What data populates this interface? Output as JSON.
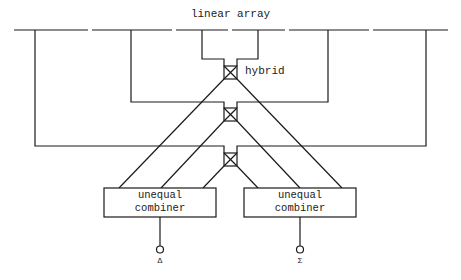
{
  "diagram": {
    "title": "linear array",
    "hybrid_label": "hybrid",
    "combiners": [
      {
        "line1": "unequal",
        "line2": "combiner",
        "output_label": "Δ"
      },
      {
        "line1": "unequal",
        "line2": "combiner",
        "output_label": "Σ"
      }
    ],
    "colors": {
      "stroke": "#1a1a1a",
      "background": "#ffffff"
    }
  }
}
